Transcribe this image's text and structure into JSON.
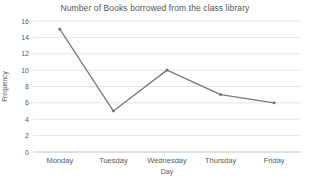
{
  "chart_data": {
    "type": "line",
    "title": "Number of Books borrowed from the class library",
    "xlabel": "Day",
    "ylabel": "Frequency",
    "categories": [
      "Monday",
      "Tuesday",
      "Wednesday",
      "Thursday",
      "Friday"
    ],
    "series": [
      {
        "name": "Frequency",
        "values": [
          15,
          5,
          10,
          7,
          6
        ]
      }
    ],
    "ylim": [
      0,
      16
    ],
    "ytick_step": 2,
    "grid": "horizontal",
    "legend_position": "none",
    "colors": {
      "line": "#7a7a7a",
      "marker": "#6e6e6e",
      "gridline": "#e4e4e4",
      "axis_line": "#bfbfbf",
      "title_text": "#555555",
      "tick_text": "#595959",
      "background": "#ffffff"
    }
  }
}
